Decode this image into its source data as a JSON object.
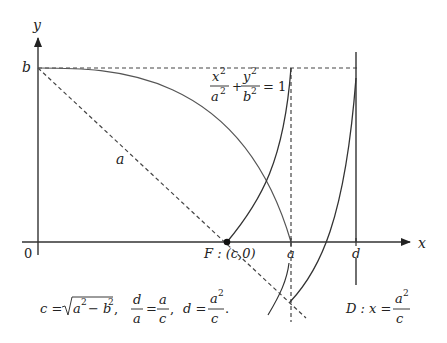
{
  "axes": {
    "x_label": "x",
    "y_label": "y",
    "origin_label": "0"
  },
  "points": {
    "b_label": "b",
    "focus_label": "F : (c,0)",
    "a_label": "a",
    "d_label": "d",
    "hypotenuse_label": "a"
  },
  "ellipse_equation": {
    "term1_num": "x",
    "term1_den": "a",
    "plus": "+",
    "term2_num": "y",
    "term2_den": "b",
    "exp": "2",
    "rhs": "= 1"
  },
  "relations": {
    "c_def_lhs": "c =",
    "c_def_radicand": "a",
    "c_def_minus": "− b",
    "exp": "2",
    "ratio_num1": "d",
    "ratio_den1": "a",
    "ratio_num2": "a",
    "ratio_den2": "c",
    "d_def_lhs": "d =",
    "d_def_num": "a",
    "d_def_den": "c",
    "comma": ",",
    "period": "."
  },
  "directrix": {
    "lhs": "D : x =",
    "num": "a",
    "den": "c",
    "exp": "2"
  }
}
